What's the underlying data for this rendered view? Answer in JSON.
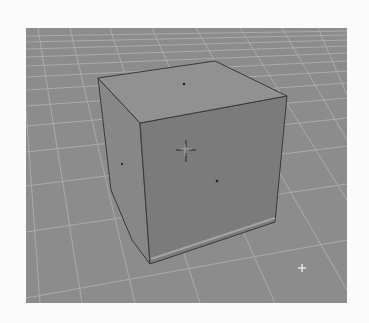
{
  "viewport": {
    "label": "3D Viewport",
    "background": "#8c8c8c",
    "grid_color": "#b4b4b4",
    "object": {
      "name": "Cube",
      "edge_color": "#3a3a3a",
      "top_face_color": "#8f8f8f",
      "left_face_color": "#888888",
      "front_face_color": "#7b7b7b"
    },
    "cursor_3d": {
      "x": 186,
      "y": 150
    },
    "lamp_marker": {
      "x": 302,
      "y": 268
    }
  }
}
